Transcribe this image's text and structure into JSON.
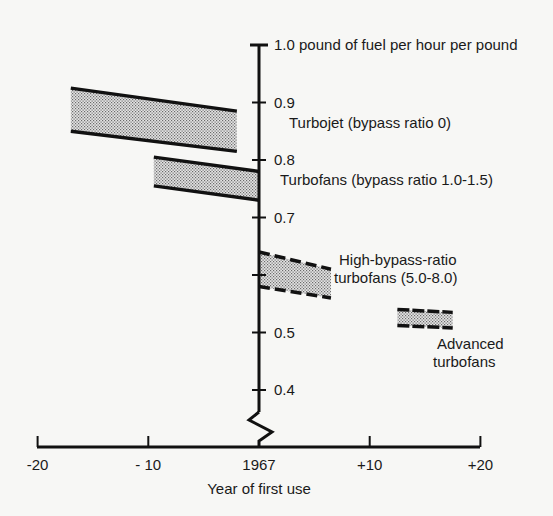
{
  "chart_data": {
    "type": "area",
    "title": "",
    "xlabel": "Year of first use",
    "ylabel": "1.0 pound of fuel per hour per pound",
    "xlim": [
      -20,
      20
    ],
    "ylim": [
      0.35,
      1.0
    ],
    "x_ticks": [
      {
        "value": -20,
        "label": "-20"
      },
      {
        "value": -10,
        "label": "- 10"
      },
      {
        "value": 0,
        "label": "1967"
      },
      {
        "value": 10,
        "label": "+10"
      },
      {
        "value": 20,
        "label": "+20"
      }
    ],
    "y_ticks": [
      {
        "value": 1.0,
        "label": "1.0 pound of fuel per hour per pound"
      },
      {
        "value": 0.9,
        "label": "0.9"
      },
      {
        "value": 0.8,
        "label": "0.8"
      },
      {
        "value": 0.7,
        "label": "0.7"
      },
      {
        "value": 0.6,
        "label": ""
      },
      {
        "value": 0.5,
        "label": "0.5"
      },
      {
        "value": 0.4,
        "label": "0.4"
      }
    ],
    "axis_break": true,
    "grid": false,
    "legend": "inline labels",
    "series": [
      {
        "name": "Turbojet (bypass ratio 0)",
        "label_lines": [
          "Turbojet (bypass ratio 0)"
        ],
        "style": "solid",
        "x": [
          -17,
          -2
        ],
        "upper": [
          0.925,
          0.885
        ],
        "lower": [
          0.85,
          0.815
        ]
      },
      {
        "name": "Turbofans (bypass ratio 1.0-1.5)",
        "label_lines": [
          "Turbofans (bypass ratio  1.0-1.5)"
        ],
        "style": "solid",
        "x": [
          -9.5,
          0
        ],
        "upper": [
          0.805,
          0.78
        ],
        "lower": [
          0.755,
          0.73
        ]
      },
      {
        "name": "High-bypass-ratio turbofans (5.0-8.0)",
        "label_lines": [
          "High-bypass-ratio",
          "turbofans (5.0-8.0)"
        ],
        "style": "dashed",
        "x": [
          0,
          6.5
        ],
        "upper": [
          0.64,
          0.61
        ],
        "lower": [
          0.58,
          0.56
        ]
      },
      {
        "name": "Advanced turbofans",
        "label_lines": [
          "Advanced",
          "turbofans"
        ],
        "style": "dashed",
        "x": [
          12.5,
          17.5
        ],
        "upper": [
          0.54,
          0.535
        ],
        "lower": [
          0.512,
          0.508
        ]
      }
    ]
  }
}
